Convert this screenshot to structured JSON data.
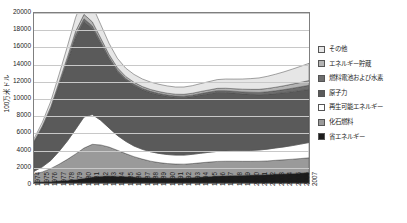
{
  "chart_data": {
    "type": "area",
    "stacked": true,
    "title": "",
    "xlabel": "",
    "ylabel": "100万米ドル",
    "ylim": [
      0,
      20000
    ],
    "ytick_step": 2000,
    "yticks": [
      0,
      2000,
      4000,
      6000,
      8000,
      10000,
      12000,
      14000,
      16000,
      18000,
      20000
    ],
    "grid": true,
    "legend_position": "right",
    "categories": [
      "1974",
      "1975",
      "1976",
      "1977",
      "1978",
      "1979",
      "1980",
      "1981",
      "1982",
      "1983",
      "1984",
      "1985",
      "1986",
      "1987",
      "1988",
      "1989",
      "1990",
      "1991",
      "1992",
      "1993",
      "1994",
      "1995",
      "1996",
      "1997",
      "1998",
      "1999",
      "2000",
      "2001",
      "2002",
      "2003",
      "2004",
      "2005",
      "2006",
      "2007"
    ],
    "series": [
      {
        "name": "省エネルギー",
        "color": "#1c1c1c",
        "values": [
          120,
          150,
          190,
          260,
          330,
          420,
          560,
          700,
          780,
          830,
          800,
          760,
          700,
          660,
          620,
          600,
          590,
          580,
          600,
          640,
          700,
          760,
          820,
          860,
          880,
          900,
          930,
          960,
          1000,
          1050,
          1080,
          1120,
          1180,
          1240
        ]
      },
      {
        "name": "化石燃料",
        "color": "#9a9a9a",
        "values": [
          900,
          1150,
          1500,
          1950,
          2450,
          3000,
          3550,
          3850,
          3700,
          3400,
          3050,
          2700,
          2400,
          2150,
          1950,
          1800,
          1700,
          1650,
          1620,
          1640,
          1680,
          1700,
          1720,
          1700,
          1680,
          1650,
          1620,
          1600,
          1600,
          1620,
          1650,
          1680,
          1700,
          1720
        ]
      },
      {
        "name": "再生可能エネルギー",
        "color": "#ffffff",
        "values": [
          350,
          600,
          950,
          1500,
          2150,
          2900,
          3650,
          3500,
          2900,
          2250,
          1750,
          1450,
          1250,
          1150,
          1100,
          1080,
          1060,
          1050,
          1060,
          1090,
          1120,
          1150,
          1180,
          1200,
          1220,
          1240,
          1280,
          1320,
          1380,
          1450,
          1520,
          1600,
          1700,
          1800
        ]
      },
      {
        "name": "原子力",
        "color": "#5a5a5a",
        "values": [
          3400,
          4600,
          6000,
          7700,
          9300,
          10800,
          11200,
          10100,
          9000,
          8100,
          7500,
          7200,
          7100,
          7000,
          6950,
          6900,
          6850,
          6800,
          6780,
          6800,
          6850,
          6900,
          6950,
          6900,
          6800,
          6700,
          6600,
          6500,
          6450,
          6400,
          6380,
          6350,
          6300,
          6250
        ]
      },
      {
        "name": "燃料電池および水素",
        "color": "#6e6e6e",
        "values": [
          60,
          90,
          130,
          180,
          240,
          300,
          360,
          330,
          280,
          230,
          200,
          180,
          170,
          165,
          160,
          158,
          156,
          155,
          158,
          165,
          175,
          185,
          195,
          205,
          215,
          230,
          250,
          275,
          300,
          330,
          360,
          400,
          440,
          480
        ]
      },
      {
        "name": "エネルギー貯蔵",
        "color": "#b4b4b4",
        "values": [
          90,
          130,
          180,
          250,
          330,
          430,
          520,
          480,
          400,
          330,
          280,
          250,
          235,
          225,
          220,
          215,
          212,
          210,
          215,
          225,
          240,
          255,
          270,
          285,
          300,
          320,
          340,
          365,
          390,
          420,
          450,
          485,
          520,
          560
        ]
      },
      {
        "name": "その他",
        "color": "#e6e6e6",
        "values": [
          280,
          420,
          620,
          900,
          1250,
          1650,
          2050,
          1900,
          1600,
          1300,
          1100,
          980,
          920,
          890,
          870,
          860,
          850,
          845,
          860,
          890,
          930,
          980,
          1030,
          1080,
          1130,
          1190,
          1260,
          1340,
          1430,
          1530,
          1640,
          1760,
          1890,
          2030
        ]
      }
    ],
    "peak_year": "1980",
    "peak_total": 20000
  },
  "legend": {
    "items": [
      {
        "label": "その他",
        "color": "#e6e6e6"
      },
      {
        "label": "エネルギー貯蔵",
        "color": "#b4b4b4"
      },
      {
        "label": "燃料電池および水素",
        "color": "#6e6e6e"
      },
      {
        "label": "原子力",
        "color": "#5a5a5a"
      },
      {
        "label": "再生可能エネルギー",
        "color": "#ffffff"
      },
      {
        "label": "化石燃料",
        "color": "#9a9a9a"
      },
      {
        "label": "省エネルギー",
        "color": "#1c1c1c"
      }
    ]
  }
}
